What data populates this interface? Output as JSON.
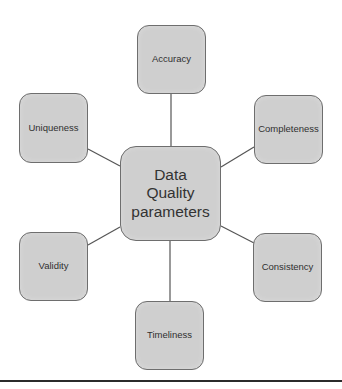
{
  "diagram": {
    "type": "hub-and-spoke",
    "center": {
      "label_line1": "Data",
      "label_line2": "Quality",
      "label_line3": "parameters"
    },
    "nodes": [
      {
        "id": "accuracy",
        "label": "Accuracy",
        "position": "top"
      },
      {
        "id": "completeness",
        "label": "Completeness",
        "position": "upper-right"
      },
      {
        "id": "consistency",
        "label": "Consistency",
        "position": "lower-right"
      },
      {
        "id": "timeliness",
        "label": "Timeliness",
        "position": "bottom"
      },
      {
        "id": "validity",
        "label": "Validity",
        "position": "lower-left"
      },
      {
        "id": "uniqueness",
        "label": "Uniqueness",
        "position": "upper-left"
      }
    ],
    "colors": {
      "node_fill": "#cfcfcf",
      "node_border": "#6e6e6e",
      "connector": "#555555",
      "text": "#2f2f2f",
      "rule": "#2b2b2b"
    }
  }
}
